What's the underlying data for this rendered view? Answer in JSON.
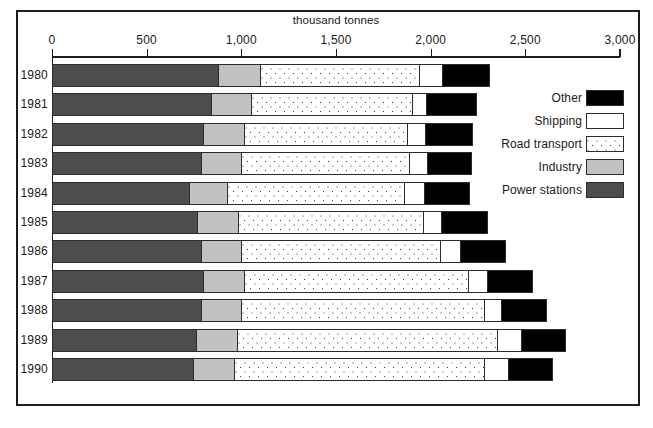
{
  "chart_data": {
    "type": "bar",
    "orientation": "horizontal",
    "stacked": true,
    "title": "thousand tonnes",
    "xlabel": "thousand tonnes",
    "ylabel": "",
    "xlim": [
      0,
      3000
    ],
    "xticks": [
      0,
      500,
      1000,
      1500,
      2000,
      2500,
      3000
    ],
    "xtick_labels": [
      "0",
      "500",
      "1,000",
      "1,500",
      "2,000",
      "2,500",
      "3,000"
    ],
    "grid": false,
    "legend_position": "right",
    "categories": [
      "1980",
      "1981",
      "1982",
      "1983",
      "1984",
      "1985",
      "1986",
      "1987",
      "1988",
      "1989",
      "1990"
    ],
    "series": [
      {
        "name": "Power stations",
        "color": "#4d4d4d",
        "values": [
          880,
          845,
          805,
          790,
          730,
          770,
          790,
          805,
          790,
          765,
          750
        ]
      },
      {
        "name": "Industry",
        "color": "#c2c2c2",
        "values": [
          225,
          210,
          215,
          215,
          200,
          220,
          215,
          215,
          215,
          215,
          215
        ]
      },
      {
        "name": "Road transport",
        "color": "#ffffff",
        "pattern": "dotted",
        "values": [
          840,
          850,
          860,
          885,
          935,
          975,
          1050,
          1180,
          1280,
          1375,
          1320
        ]
      },
      {
        "name": "Shipping",
        "color": "#ffffff",
        "values": [
          120,
          75,
          95,
          95,
          105,
          95,
          105,
          105,
          90,
          125,
          130
        ]
      },
      {
        "name": "Other",
        "color": "#000000",
        "values": [
          250,
          265,
          250,
          235,
          240,
          245,
          240,
          235,
          240,
          235,
          230
        ]
      }
    ],
    "totals": [
      2315,
      2245,
      2225,
      2220,
      2210,
      2305,
      2400,
      2540,
      2615,
      2715,
      2645
    ]
  },
  "axis": {
    "title": "thousand tonnes",
    "ticks": [
      {
        "value": 0,
        "label": "0"
      },
      {
        "value": 500,
        "label": "500"
      },
      {
        "value": 1000,
        "label": "1,000"
      },
      {
        "value": 1500,
        "label": "1,500"
      },
      {
        "value": 2000,
        "label": "2,000"
      },
      {
        "value": 2500,
        "label": "2,500"
      },
      {
        "value": 3000,
        "label": "3,000"
      }
    ]
  },
  "rows": [
    {
      "year": "1980"
    },
    {
      "year": "1981"
    },
    {
      "year": "1982"
    },
    {
      "year": "1983"
    },
    {
      "year": "1984"
    },
    {
      "year": "1985"
    },
    {
      "year": "1986"
    },
    {
      "year": "1987"
    },
    {
      "year": "1988"
    },
    {
      "year": "1989"
    },
    {
      "year": "1990"
    }
  ],
  "legend": {
    "items": [
      {
        "label": "Other",
        "key": "other"
      },
      {
        "label": "Shipping",
        "key": "shipping"
      },
      {
        "label": "Road transport",
        "key": "road"
      },
      {
        "label": "Industry",
        "key": "industry"
      },
      {
        "label": "Power stations",
        "key": "power"
      }
    ]
  },
  "colors": {
    "power": "#4d4d4d",
    "industry": "#c2c2c2",
    "road": "#ffffff",
    "shipping": "#ffffff",
    "other": "#000000",
    "outline": "#2b2b2b",
    "frame": "#1c1c1c"
  }
}
